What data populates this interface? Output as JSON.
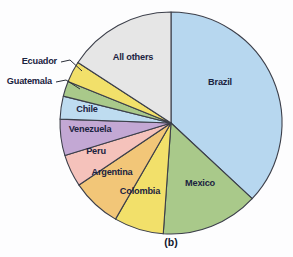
{
  "figure": {
    "caption": "(b)",
    "background_color": "#fdfdfe",
    "outline_color": "#3c3f4a",
    "label_color": "#1b2340"
  },
  "chart_data": {
    "type": "pie",
    "title": "",
    "subtitle": "",
    "xlabel": "",
    "ylabel": "",
    "caption": "(b)",
    "legend_position": "none",
    "labels_inline": true,
    "start_angle_deg": 0,
    "direction": "clockwise",
    "center": {
      "x": 171,
      "y": 123
    },
    "radius": 111,
    "categories": [
      "Brazil",
      "Mexico",
      "Colombia",
      "Argentina",
      "Peru",
      "Venezuela",
      "Chile",
      "Guatemala",
      "Ecuador",
      "All others"
    ],
    "values": [
      36.9,
      14.2,
      7.2,
      7.2,
      4.7,
      5.3,
      3.3,
      2.2,
      3.1,
      15.9
    ],
    "units": "percent",
    "slices": [
      {
        "label": "Brazil",
        "value": 36.9,
        "color": "#b7d7ef",
        "start_deg": 0.0,
        "end_deg": 133.0,
        "label_x": 220,
        "label_y": 83,
        "callout": false
      },
      {
        "label": "Mexico",
        "value": 14.2,
        "color": "#a9c98a",
        "start_deg": 133.0,
        "end_deg": 184.0,
        "label_x": 200,
        "label_y": 184,
        "callout": false
      },
      {
        "label": "Colombia",
        "value": 7.2,
        "color": "#f2e06a",
        "start_deg": 184.0,
        "end_deg": 210.0,
        "label_x": 140,
        "label_y": 192,
        "callout": false
      },
      {
        "label": "Argentina",
        "value": 7.2,
        "color": "#f2c678",
        "start_deg": 210.0,
        "end_deg": 236.0,
        "label_x": 112,
        "label_y": 173,
        "callout": false
      },
      {
        "label": "Peru",
        "value": 4.7,
        "color": "#f5c2bb",
        "start_deg": 236.0,
        "end_deg": 253.0,
        "label_x": 96,
        "label_y": 152,
        "callout": false
      },
      {
        "label": "Venezuela",
        "value": 5.3,
        "color": "#c3a8d4",
        "start_deg": 253.0,
        "end_deg": 272.0,
        "label_x": 90,
        "label_y": 130,
        "callout": false
      },
      {
        "label": "Chile",
        "value": 3.3,
        "color": "#bedcf0",
        "start_deg": 272.0,
        "end_deg": 284.0,
        "label_x": 87,
        "label_y": 110,
        "callout": false
      },
      {
        "label": "Guatemala",
        "value": 2.2,
        "color": "#a9c98a",
        "start_deg": 284.0,
        "end_deg": 292.0,
        "label_x": 52,
        "label_y": 82,
        "callout": true,
        "leader": "M 56 82 L 66 80 L 80 89"
      },
      {
        "label": "Ecuador",
        "value": 3.1,
        "color": "#f2e06a",
        "start_deg": 292.0,
        "end_deg": 303.0,
        "label_x": 57,
        "label_y": 62,
        "callout": true,
        "leader": "M 61 62 L 70 60 L 82 71"
      },
      {
        "label": "All others",
        "value": 15.9,
        "color": "#e6e6e6",
        "start_deg": 303.0,
        "end_deg": 360.0,
        "label_x": 133,
        "label_y": 58,
        "callout": false
      }
    ]
  }
}
